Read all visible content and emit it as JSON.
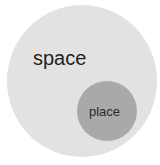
{
  "diagram": {
    "type": "euler",
    "outer": {
      "label": "space",
      "color": "#e2e2e2"
    },
    "inner": {
      "label": "place",
      "color": "#a9a9a9"
    },
    "relation": "place is contained within space"
  }
}
